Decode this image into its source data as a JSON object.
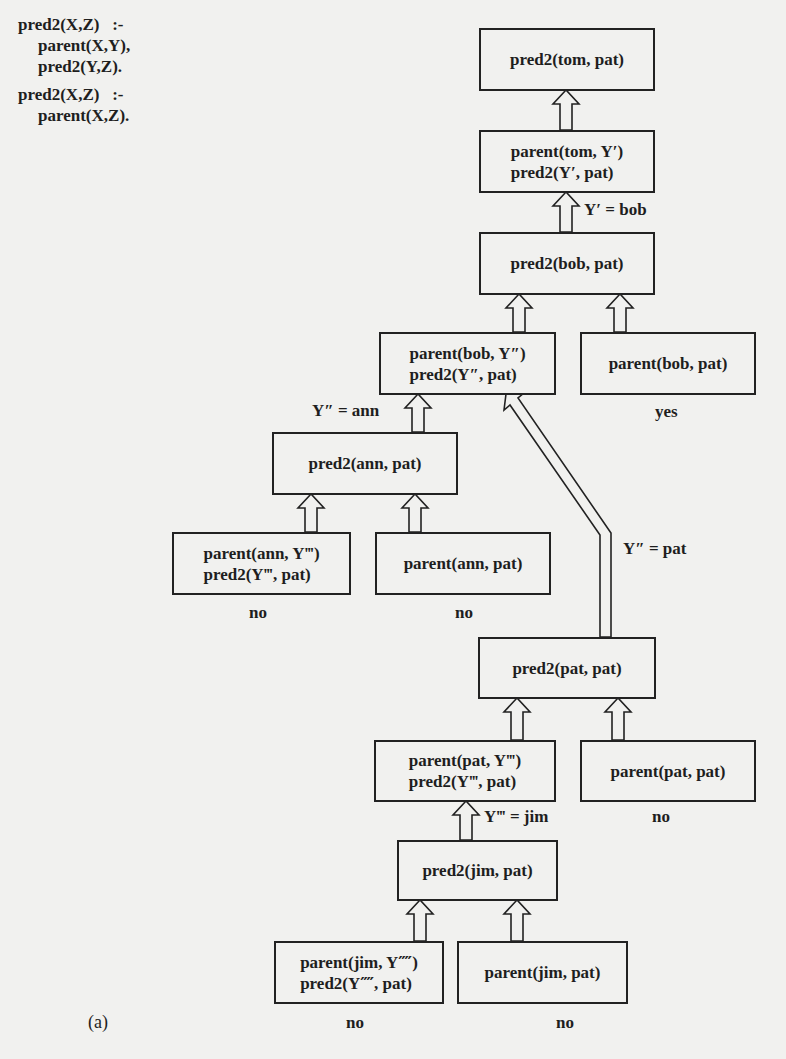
{
  "figure": {
    "caption": "(a)",
    "program": [
      {
        "head": "pred2(X,Z)   :-",
        "body": [
          "parent(X,Y),",
          "pred2(Y,Z)."
        ]
      },
      {
        "head": "pred2(X,Z)   :-",
        "body": [
          "parent(X,Z)."
        ]
      }
    ],
    "nodes": [
      {
        "id": "n1",
        "lines": [
          "pred2(tom, pat)"
        ]
      },
      {
        "id": "n2",
        "lines": [
          "parent(tom, Y′)",
          "pred2(Y′, pat)"
        ]
      },
      {
        "id": "n3",
        "lines": [
          "pred2(bob, pat)"
        ]
      },
      {
        "id": "n4",
        "lines": [
          "parent(bob, Y″)",
          "pred2(Y″, pat)"
        ]
      },
      {
        "id": "n5",
        "lines": [
          "parent(bob, pat)"
        ],
        "result": "yes"
      },
      {
        "id": "n6",
        "lines": [
          "pred2(ann, pat)"
        ]
      },
      {
        "id": "n7",
        "lines": [
          "parent(ann, Y‴)",
          "pred2(Y‴, pat)"
        ],
        "result": "no"
      },
      {
        "id": "n8",
        "lines": [
          "parent(ann, pat)"
        ],
        "result": "no"
      },
      {
        "id": "n9",
        "lines": [
          "pred2(pat, pat)"
        ]
      },
      {
        "id": "n10",
        "lines": [
          "parent(pat, Y‴)",
          "pred2(Y‴, pat)"
        ]
      },
      {
        "id": "n11",
        "lines": [
          "parent(pat, pat)"
        ],
        "result": "no"
      },
      {
        "id": "n12",
        "lines": [
          "pred2(jim, pat)"
        ]
      },
      {
        "id": "n13",
        "lines": [
          "parent(jim, Y⁗)",
          "pred2(Y⁗, pat)"
        ],
        "result": "no"
      },
      {
        "id": "n14",
        "lines": [
          "parent(jim, pat)"
        ],
        "result": "no"
      }
    ],
    "edge_labels": {
      "y1_bob": "Y′ = bob",
      "y2_ann": "Y″ = ann",
      "y2_pat": "Y″ = pat",
      "y3_jim": "Y‴ = jim"
    },
    "edges": [
      {
        "from": "n2",
        "to": "n1"
      },
      {
        "from": "n3",
        "to": "n2",
        "label": "Y′ = bob"
      },
      {
        "from": "n4",
        "to": "n3"
      },
      {
        "from": "n5",
        "to": "n3"
      },
      {
        "from": "n6",
        "to": "n4",
        "label": "Y″ = ann"
      },
      {
        "from": "n9",
        "to": "n4",
        "label": "Y″ = pat"
      },
      {
        "from": "n7",
        "to": "n6"
      },
      {
        "from": "n8",
        "to": "n6"
      },
      {
        "from": "n10",
        "to": "n9"
      },
      {
        "from": "n11",
        "to": "n9"
      },
      {
        "from": "n12",
        "to": "n10",
        "label": "Y‴ = jim"
      },
      {
        "from": "n13",
        "to": "n12"
      },
      {
        "from": "n14",
        "to": "n12"
      }
    ]
  }
}
